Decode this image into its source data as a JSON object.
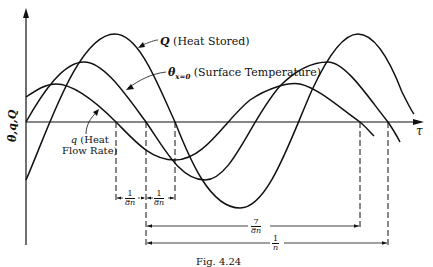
{
  "figure": {
    "axes": {
      "y_label": "θ,q,Q",
      "x_label": "τ"
    },
    "curves": {
      "Q": {
        "symbol": "Q",
        "label": "(Heat Stored)"
      },
      "theta": {
        "symbol": "θ",
        "subscript": "x=0",
        "label": "(Surface Temperature)"
      },
      "q": {
        "symbol": "q",
        "label_line1": "(Heat",
        "label_line2": "Flow Rate)"
      }
    },
    "dimensions": {
      "d1": {
        "num": "1",
        "den": "8n"
      },
      "d2": {
        "num": "1",
        "den": "8n"
      },
      "d3": {
        "num": "7",
        "den": "8n"
      },
      "d4": {
        "num": "1",
        "den": "n"
      }
    },
    "caption": "Fig. 4.24"
  }
}
